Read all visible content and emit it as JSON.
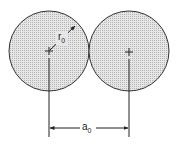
{
  "diagram": {
    "circle_fill": "#d9d9d9",
    "stroke_color": "#333333",
    "circles": [
      {
        "cx": 49,
        "cy": 51,
        "r": 40
      },
      {
        "cx": 129,
        "cy": 51,
        "r": 40
      }
    ],
    "labels": {
      "radius": {
        "base": "r",
        "sub": "0"
      },
      "separation": {
        "base": "a",
        "sub": "0"
      }
    }
  }
}
